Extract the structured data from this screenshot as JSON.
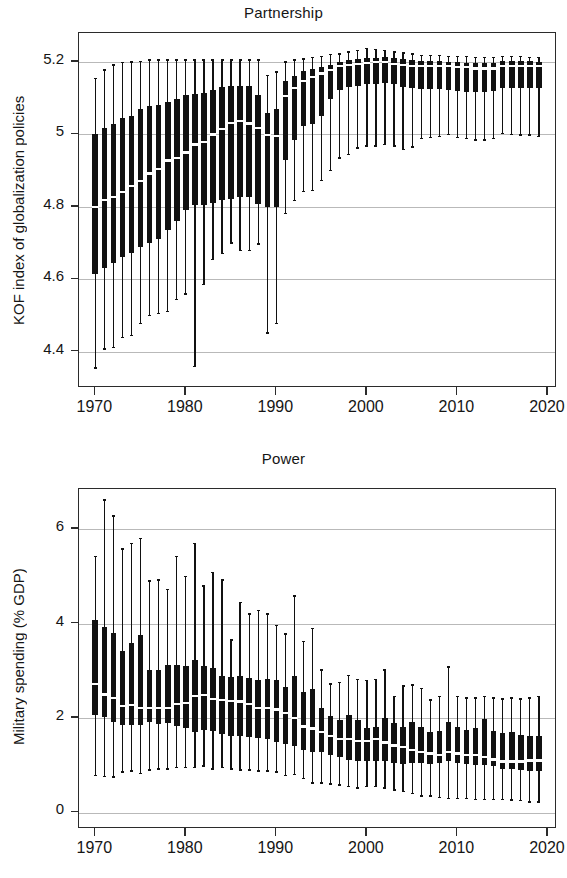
{
  "figure": {
    "kind": "two-panel box-plot figure",
    "background": "#ffffff",
    "ink_color": "#111111",
    "grid_color": "#b9b9b9",
    "median_color": "#ffffff"
  },
  "panels": [
    {
      "id": "partnership",
      "title": "Partnership",
      "ylabel": "KOF index of globalization policies"
    },
    {
      "id": "power",
      "title": "Power",
      "ylabel": "Military spending (% GDP)"
    }
  ],
  "chart_data": [
    {
      "type": "boxplot",
      "title": "Partnership",
      "xlabel": "",
      "ylabel": "KOF index of globalization policies",
      "xlim": [
        1968.2,
        2021.0
      ],
      "ylim": [
        4.3,
        5.28
      ],
      "yticks": [
        4.4,
        4.6,
        4.8,
        5,
        5.2
      ],
      "ytick_labels": [
        "4.4",
        "4.6",
        "4.8",
        "5",
        "5.2"
      ],
      "xticks": [
        1970,
        1980,
        1990,
        2000,
        2010,
        2020
      ],
      "xtick_labels": [
        "1970",
        "1980",
        "1990",
        "2000",
        "2010",
        "2020"
      ],
      "grid": "horizontal",
      "legend": "none",
      "box_stats_keys": [
        "year",
        "lower_whisker",
        "q1",
        "median",
        "q3",
        "upper_whisker"
      ],
      "boxes": [
        [
          1970,
          4.355,
          4.615,
          4.8,
          5.0,
          5.155
        ],
        [
          1971,
          4.408,
          4.632,
          4.818,
          5.018,
          5.178
        ],
        [
          1972,
          4.412,
          4.645,
          4.828,
          5.028,
          5.192
        ],
        [
          1973,
          4.44,
          4.662,
          4.842,
          5.045,
          5.198
        ],
        [
          1974,
          4.445,
          4.672,
          4.858,
          5.052,
          5.2
        ],
        [
          1975,
          4.478,
          4.688,
          4.872,
          5.07,
          5.202
        ],
        [
          1976,
          4.5,
          4.7,
          4.892,
          5.078,
          5.205
        ],
        [
          1977,
          4.505,
          4.71,
          4.905,
          5.082,
          5.205
        ],
        [
          1978,
          4.512,
          4.735,
          4.928,
          5.09,
          5.205
        ],
        [
          1979,
          4.545,
          4.76,
          4.935,
          5.098,
          5.205
        ],
        [
          1980,
          4.56,
          4.792,
          4.95,
          5.108,
          5.205
        ],
        [
          1981,
          4.36,
          4.805,
          4.972,
          5.112,
          5.205
        ],
        [
          1982,
          4.585,
          4.805,
          4.978,
          5.115,
          5.205
        ],
        [
          1983,
          4.655,
          4.812,
          5.0,
          5.122,
          5.205
        ],
        [
          1984,
          4.672,
          4.818,
          5.015,
          5.13,
          5.205
        ],
        [
          1985,
          4.7,
          4.822,
          5.032,
          5.135,
          5.205
        ],
        [
          1986,
          4.68,
          4.828,
          5.038,
          5.135,
          5.205
        ],
        [
          1987,
          4.68,
          4.828,
          5.03,
          5.135,
          5.205
        ],
        [
          1988,
          4.698,
          4.808,
          5.018,
          5.108,
          5.205
        ],
        [
          1989,
          4.452,
          4.8,
          4.998,
          5.06,
          5.162
        ],
        [
          1990,
          4.478,
          4.8,
          4.995,
          5.07,
          5.172
        ],
        [
          1991,
          4.782,
          4.93,
          5.105,
          5.148,
          5.2
        ],
        [
          1992,
          4.818,
          4.985,
          5.128,
          5.16,
          5.205
        ],
        [
          1993,
          4.842,
          5.022,
          5.148,
          5.175,
          5.208
        ],
        [
          1994,
          4.845,
          5.03,
          5.158,
          5.182,
          5.212
        ],
        [
          1995,
          4.872,
          5.05,
          5.168,
          5.185,
          5.215
        ],
        [
          1996,
          4.9,
          5.098,
          5.178,
          5.192,
          5.22
        ],
        [
          1997,
          4.935,
          5.122,
          5.188,
          5.2,
          5.222
        ],
        [
          1998,
          4.945,
          5.13,
          5.192,
          5.205,
          5.228
        ],
        [
          1999,
          4.962,
          5.135,
          5.195,
          5.208,
          5.232
        ],
        [
          2000,
          4.968,
          5.14,
          5.198,
          5.212,
          5.238
        ],
        [
          2001,
          4.968,
          5.14,
          5.2,
          5.212,
          5.235
        ],
        [
          2002,
          4.972,
          5.142,
          5.2,
          5.215,
          5.232
        ],
        [
          2003,
          4.968,
          5.138,
          5.195,
          5.212,
          5.228
        ],
        [
          2004,
          4.958,
          5.132,
          5.192,
          5.208,
          5.225
        ],
        [
          2005,
          4.965,
          5.128,
          5.19,
          5.205,
          5.222
        ],
        [
          2006,
          4.988,
          5.125,
          5.188,
          5.202,
          5.218
        ],
        [
          2007,
          4.992,
          5.125,
          5.188,
          5.202,
          5.218
        ],
        [
          2008,
          4.995,
          5.125,
          5.188,
          5.202,
          5.218
        ],
        [
          2009,
          5.0,
          5.122,
          5.188,
          5.2,
          5.215
        ],
        [
          2010,
          4.992,
          5.12,
          5.185,
          5.2,
          5.215
        ],
        [
          2011,
          4.988,
          5.118,
          5.185,
          5.198,
          5.215
        ],
        [
          2012,
          4.985,
          5.118,
          5.182,
          5.198,
          5.212
        ],
        [
          2013,
          4.985,
          5.118,
          5.182,
          5.198,
          5.212
        ],
        [
          2014,
          4.988,
          5.12,
          5.182,
          5.198,
          5.212
        ],
        [
          2015,
          5.002,
          5.128,
          5.188,
          5.202,
          5.215
        ],
        [
          2016,
          5.0,
          5.128,
          5.188,
          5.202,
          5.215
        ],
        [
          2017,
          4.998,
          5.128,
          5.188,
          5.202,
          5.215
        ],
        [
          2018,
          4.998,
          5.128,
          5.188,
          5.202,
          5.212
        ],
        [
          2019,
          4.995,
          5.128,
          5.188,
          5.2,
          5.212
        ]
      ]
    },
    {
      "type": "boxplot",
      "title": "Power",
      "xlabel": "",
      "ylabel": "Military spending (% GDP)",
      "xlim": [
        1968.2,
        2021.0
      ],
      "ylim": [
        -0.35,
        6.85
      ],
      "yticks": [
        0,
        2,
        4,
        6
      ],
      "ytick_labels": [
        "0",
        "2",
        "4",
        "6"
      ],
      "xticks": [
        1970,
        1980,
        1990,
        2000,
        2010,
        2020
      ],
      "xtick_labels": [
        "1970",
        "1980",
        "1990",
        "2000",
        "2010",
        "2020"
      ],
      "grid": "horizontal",
      "legend": "none",
      "box_stats_keys": [
        "year",
        "lower_whisker",
        "q1",
        "median",
        "q3",
        "upper_whisker"
      ],
      "boxes": [
        [
          1970,
          0.78,
          2.07,
          2.72,
          4.08,
          5.42
        ],
        [
          1971,
          0.76,
          2.02,
          2.5,
          3.92,
          6.62
        ],
        [
          1972,
          0.75,
          1.92,
          2.42,
          3.8,
          6.28
        ],
        [
          1973,
          0.86,
          1.86,
          2.25,
          3.42,
          5.58
        ],
        [
          1974,
          0.88,
          1.85,
          2.28,
          3.58,
          5.7
        ],
        [
          1975,
          0.82,
          1.86,
          2.22,
          3.75,
          5.8
        ],
        [
          1976,
          0.9,
          1.92,
          2.22,
          3.02,
          4.9
        ],
        [
          1977,
          0.92,
          1.88,
          2.22,
          3.02,
          4.92
        ],
        [
          1978,
          0.92,
          1.9,
          2.22,
          3.12,
          4.72
        ],
        [
          1979,
          0.95,
          1.84,
          2.3,
          3.12,
          5.42
        ],
        [
          1980,
          0.95,
          1.78,
          2.32,
          3.1,
          5.0
        ],
        [
          1981,
          0.95,
          1.7,
          2.46,
          3.22,
          5.7
        ],
        [
          1982,
          0.98,
          1.75,
          2.48,
          3.1,
          4.8
        ],
        [
          1983,
          0.92,
          1.72,
          2.4,
          3.06,
          5.08
        ],
        [
          1984,
          0.95,
          1.66,
          2.38,
          2.9,
          4.92
        ],
        [
          1985,
          0.92,
          1.62,
          2.36,
          2.86,
          3.65
        ],
        [
          1986,
          0.9,
          1.62,
          2.35,
          2.88,
          4.45
        ],
        [
          1987,
          0.9,
          1.6,
          2.3,
          2.85,
          4.2
        ],
        [
          1988,
          0.88,
          1.58,
          2.22,
          2.8,
          4.28
        ],
        [
          1989,
          0.88,
          1.55,
          2.22,
          2.82,
          4.2
        ],
        [
          1990,
          0.86,
          1.5,
          2.18,
          2.8,
          3.96
        ],
        [
          1991,
          0.78,
          1.45,
          2.1,
          2.65,
          3.78
        ],
        [
          1992,
          0.8,
          1.4,
          2.0,
          2.88,
          4.58
        ],
        [
          1993,
          0.72,
          1.32,
          1.82,
          2.55,
          3.62
        ],
        [
          1994,
          0.62,
          1.28,
          1.78,
          2.62,
          3.9
        ],
        [
          1995,
          0.62,
          1.28,
          1.7,
          2.22,
          3.02
        ],
        [
          1996,
          0.6,
          1.22,
          1.62,
          2.05,
          2.72
        ],
        [
          1997,
          0.58,
          1.18,
          1.55,
          1.95,
          2.75
        ],
        [
          1998,
          0.55,
          1.12,
          1.56,
          2.06,
          2.9
        ],
        [
          1999,
          0.52,
          1.08,
          1.52,
          1.95,
          2.82
        ],
        [
          2000,
          0.55,
          1.1,
          1.52,
          1.78,
          2.8
        ],
        [
          2001,
          0.55,
          1.1,
          1.55,
          1.8,
          2.82
        ],
        [
          2002,
          0.52,
          1.1,
          1.48,
          2.0,
          3.02
        ],
        [
          2003,
          0.48,
          1.05,
          1.42,
          1.9,
          2.45
        ],
        [
          2004,
          0.44,
          1.02,
          1.38,
          1.82,
          2.68
        ],
        [
          2005,
          0.4,
          1.05,
          1.32,
          1.92,
          2.7
        ],
        [
          2006,
          0.35,
          1.05,
          1.28,
          1.8,
          2.62
        ],
        [
          2007,
          0.35,
          1.02,
          1.25,
          1.7,
          2.38
        ],
        [
          2008,
          0.32,
          1.05,
          1.22,
          1.72,
          2.45
        ],
        [
          2009,
          0.3,
          1.08,
          1.28,
          1.92,
          3.08
        ],
        [
          2010,
          0.3,
          1.05,
          1.25,
          1.82,
          2.45
        ],
        [
          2011,
          0.3,
          1.02,
          1.22,
          1.75,
          2.42
        ],
        [
          2012,
          0.28,
          1.0,
          1.22,
          1.78,
          2.42
        ],
        [
          2013,
          0.28,
          1.0,
          1.18,
          1.98,
          2.45
        ],
        [
          2014,
          0.28,
          0.98,
          1.12,
          1.72,
          2.42
        ],
        [
          2015,
          0.28,
          0.92,
          1.08,
          1.68,
          2.4
        ],
        [
          2016,
          0.26,
          0.92,
          1.08,
          1.7,
          2.42
        ],
        [
          2017,
          0.25,
          0.9,
          1.08,
          1.65,
          2.4
        ],
        [
          2018,
          0.22,
          0.88,
          1.1,
          1.62,
          2.42
        ],
        [
          2019,
          0.22,
          0.88,
          1.1,
          1.62,
          2.45
        ]
      ]
    }
  ]
}
